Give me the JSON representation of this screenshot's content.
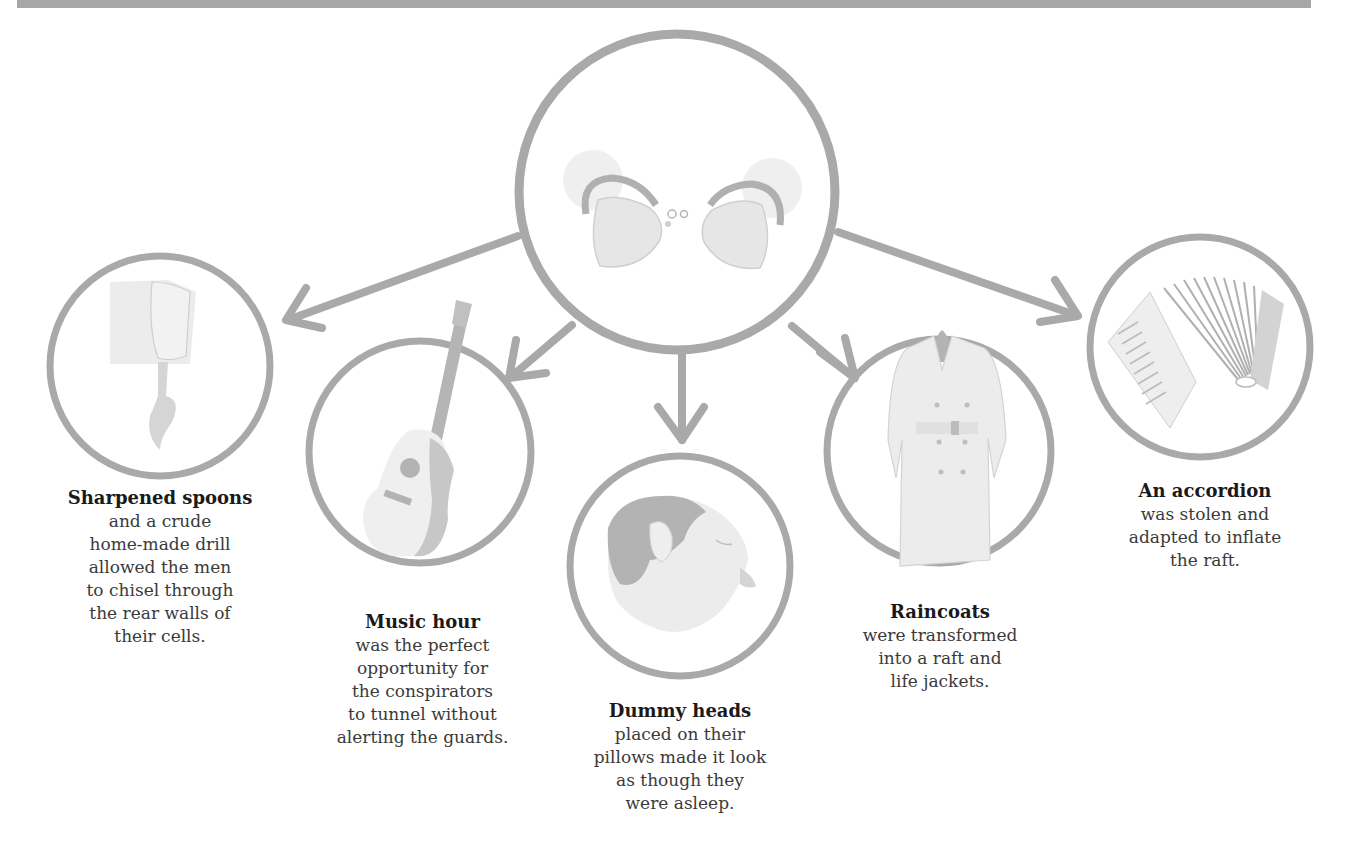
{
  "colors": {
    "outline": "#a9a9a9",
    "illustration_light": "#e9e9e9",
    "illustration_mid": "#c8c8c8",
    "illustration_dark": "#a8a8a8",
    "heading_text": "#1a1a1a",
    "body_text": "#3a3a3a",
    "top_bar": "#a7a7a7"
  },
  "center": {
    "icon": "handcuffs-broken-icon"
  },
  "items": [
    {
      "icon": "sharpened-spoon-fist-icon",
      "title": "Sharpened spoons",
      "body": "and a crude\nhome-made drill\nallowed the men\nto chisel through\nthe rear walls of\ntheir cells."
    },
    {
      "icon": "acoustic-guitar-icon",
      "title": "Music hour",
      "body": "was the perfect\nopportunity for\nthe conspirators\nto tunnel without\nalerting the guards."
    },
    {
      "icon": "dummy-head-icon",
      "title": "Dummy heads",
      "body": "placed on their\npillows made it look\nas though they\nwere asleep."
    },
    {
      "icon": "raincoat-icon",
      "title": "Raincoats",
      "body": "were transformed\ninto a raft and\nlife jackets."
    },
    {
      "icon": "accordion-icon",
      "title": "An accordion",
      "body": "was stolen and\nadapted to inflate\nthe raft."
    }
  ]
}
